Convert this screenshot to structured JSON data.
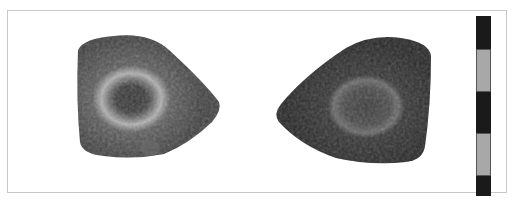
{
  "figure": {
    "alt": "Two views of a teardrop-shaped stone artifact with a central circular depression, photographed against white with a black-and-grey scale bar",
    "background": "#ffffff",
    "frame_color": "#c8c8c8"
  },
  "artifacts": [
    {
      "view": "left",
      "shape": "teardrop-pointing-right",
      "surface_color": "#4a4a4a",
      "ring_highlight": "#b8b8b8",
      "center_color": "#2e2e2e"
    },
    {
      "view": "right",
      "shape": "teardrop-pointing-left",
      "surface_color": "#2f2f2f",
      "ring_highlight": "#6a6a6a",
      "center_color": "#4a4a4a"
    }
  ],
  "scale_bar": {
    "segments": [
      {
        "color": "#1a1a1a"
      },
      {
        "color": "#a8a8a8"
      },
      {
        "color": "#1a1a1a"
      },
      {
        "color": "#a8a8a8"
      },
      {
        "color": "#1a1a1a"
      }
    ]
  }
}
